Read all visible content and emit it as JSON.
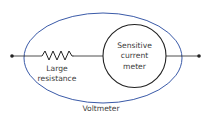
{
  "diagram": {
    "title": "Voltmeter",
    "resistor_label_line1": "Large",
    "resistor_label_line2": "resistance",
    "meter_label_line1": "Sensitive",
    "meter_label_line2": "current",
    "meter_label_line3": "meter",
    "enclosure_label": "Voltmeter",
    "colors": {
      "enclosure": "#3a5aa8",
      "wire": "#222222",
      "text": "#3a3a3a"
    }
  }
}
